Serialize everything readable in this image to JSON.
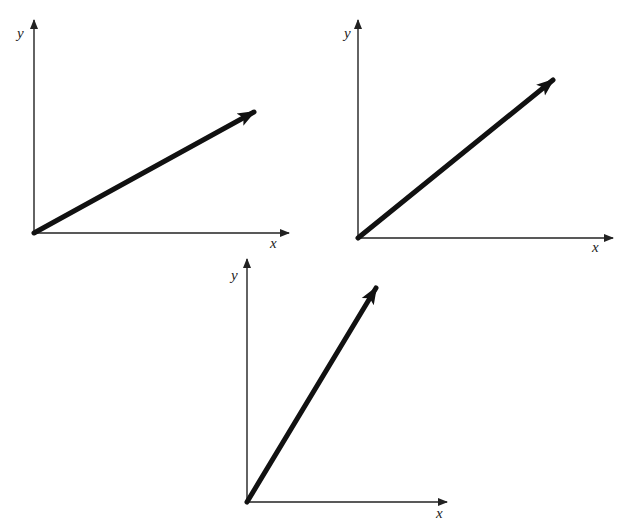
{
  "colors": {
    "background": "#ffffff",
    "axis": "#222222",
    "vector": "#111111"
  },
  "diagrams": [
    {
      "id": "top-left",
      "x_label": "x",
      "y_label": "y",
      "origin": [
        34,
        233
      ],
      "y_axis_end": [
        34,
        20
      ],
      "x_axis_end": [
        289,
        233
      ],
      "vector_tip": [
        254,
        112
      ],
      "x_label_pos": [
        270,
        248
      ],
      "y_label_pos": [
        17,
        38
      ]
    },
    {
      "id": "top-right",
      "x_label": "x",
      "y_label": "y",
      "origin": [
        358,
        238
      ],
      "y_axis_end": [
        358,
        20
      ],
      "x_axis_end": [
        613,
        238
      ],
      "vector_tip": [
        553,
        80
      ],
      "x_label_pos": [
        592,
        252
      ],
      "y_label_pos": [
        344,
        38
      ]
    },
    {
      "id": "bottom-center",
      "x_label": "x",
      "y_label": "y",
      "origin": [
        247,
        502
      ],
      "y_axis_end": [
        247,
        259
      ],
      "x_axis_end": [
        447,
        502
      ],
      "vector_tip": [
        376,
        288
      ],
      "x_label_pos": [
        436,
        518
      ],
      "y_label_pos": [
        231,
        280
      ]
    }
  ]
}
